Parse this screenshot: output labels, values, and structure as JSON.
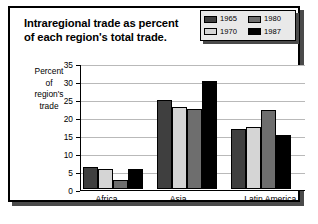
{
  "card": {
    "title_line1": "Intraregional trade as percent",
    "title_line2": "of each region's total trade."
  },
  "axis_caption": {
    "l1": "Percent",
    "l2": "of",
    "l3": "region's",
    "l4": "trade"
  },
  "legend": {
    "items": [
      {
        "label": "1965",
        "color": "#3f3f3f"
      },
      {
        "label": "1980",
        "color": "#6e6e6e"
      },
      {
        "label": "1970",
        "color": "#d5d5d5"
      },
      {
        "label": "1987",
        "color": "#000000"
      }
    ]
  },
  "chart_data": {
    "type": "bar",
    "title": "Intraregional trade as percent of each region's total trade.",
    "xlabel": "",
    "ylabel": "Percent of region's trade",
    "ylim": [
      0,
      35
    ],
    "yticks": [
      0,
      5,
      10,
      15,
      20,
      25,
      30,
      35
    ],
    "grid": true,
    "legend_position": "top-right",
    "categories": [
      "Africa",
      "Asia",
      "Latin America"
    ],
    "series": [
      {
        "name": "1965",
        "color": "#3f3f3f",
        "values": [
          6.0,
          24.6,
          16.6
        ]
      },
      {
        "name": "1970",
        "color": "#d5d5d5",
        "values": [
          5.4,
          22.6,
          17.0
        ]
      },
      {
        "name": "1980",
        "color": "#6e6e6e",
        "values": [
          2.5,
          22.0,
          21.8
        ]
      },
      {
        "name": "1987",
        "color": "#000000",
        "values": [
          5.4,
          30.0,
          14.8
        ]
      }
    ]
  }
}
